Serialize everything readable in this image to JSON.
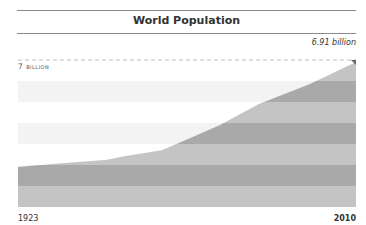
{
  "title": "World Population",
  "annotations": {
    "end_value_label": "6.91 billion",
    "reference_label": "7 billion"
  },
  "x_axis": {
    "start_label": "1923",
    "end_label": "2010"
  },
  "colors": {
    "band_dark": "#a9a9a9",
    "band_light": "#c4c4c4",
    "bg_band": "#f3f3f3",
    "rule": "#8a8a8a",
    "dash": "#bdbdbd"
  },
  "chart_data": {
    "type": "area",
    "title": "World Population",
    "xlabel": "",
    "ylabel": "",
    "x": [
      1923,
      1935,
      1946,
      1950,
      1960,
      1965,
      1975,
      1985,
      1998,
      2010
    ],
    "series": [
      {
        "name": "World Population (billions)",
        "values": [
          1.9,
          2.1,
          2.25,
          2.4,
          2.7,
          3.1,
          3.9,
          4.9,
          5.85,
          6.91
        ]
      }
    ],
    "xlim": [
      1923,
      2010
    ],
    "ylim": [
      0,
      7
    ],
    "reference_lines": [
      {
        "value": 7,
        "label": "7 billion",
        "style": "dashed"
      }
    ],
    "annotations": [
      {
        "x": 2010,
        "y": 6.91,
        "text": "6.91 billion"
      }
    ],
    "tick_labels_x": [
      "1923",
      "2010"
    ],
    "grid": false,
    "legend": "none"
  }
}
